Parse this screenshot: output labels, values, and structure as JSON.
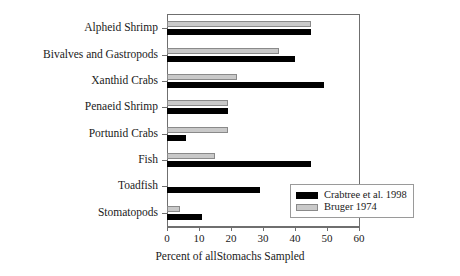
{
  "chart_data": {
    "type": "bar",
    "orientation": "horizontal",
    "title": "",
    "xlabel": "Percent of allStomachs Sampled",
    "ylabel": "",
    "xlim": [
      0,
      60
    ],
    "xticks": [
      0,
      10,
      20,
      30,
      40,
      50,
      60
    ],
    "xtick_labels": [
      "0",
      "10",
      "20",
      "30",
      "40",
      "50",
      "60"
    ],
    "grid": false,
    "legend_position": "lower-right",
    "categories": [
      "Alpheid Shrimp",
      "Bivalves and Gastropods",
      "Xanthid Crabs",
      "Penaeid Shrimp",
      "Portunid Crabs",
      "Fish",
      "Toadfish",
      "Stomatopods"
    ],
    "series": [
      {
        "name": "Crabtree et al. 1998",
        "color": "#000000",
        "values": [
          45,
          40,
          49,
          19,
          6,
          45,
          29,
          11
        ]
      },
      {
        "name": "Bruger 1974",
        "color": "#c9c9c9",
        "values": [
          45,
          35,
          22,
          19,
          19,
          15,
          0,
          4
        ]
      }
    ]
  }
}
